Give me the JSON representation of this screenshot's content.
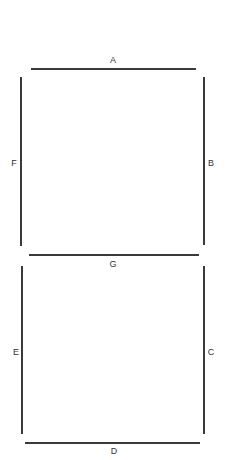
{
  "diagram": {
    "type": "seven-segment-display",
    "stroke_color": "#3a3a3a",
    "segments": [
      {
        "id": "A",
        "label": "A",
        "orientation": "horizontal",
        "position": "top"
      },
      {
        "id": "B",
        "label": "B",
        "orientation": "vertical",
        "position": "top-right"
      },
      {
        "id": "C",
        "label": "C",
        "orientation": "vertical",
        "position": "bottom-right"
      },
      {
        "id": "D",
        "label": "D",
        "orientation": "horizontal",
        "position": "bottom"
      },
      {
        "id": "E",
        "label": "E",
        "orientation": "vertical",
        "position": "bottom-left"
      },
      {
        "id": "F",
        "label": "F",
        "orientation": "vertical",
        "position": "top-left"
      },
      {
        "id": "G",
        "label": "G",
        "orientation": "horizontal",
        "position": "middle"
      }
    ]
  }
}
